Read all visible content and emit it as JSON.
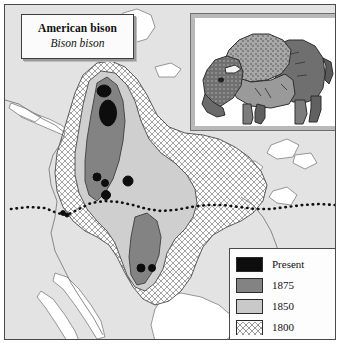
{
  "figure": {
    "title": {
      "common_name": "American bison",
      "scientific_name": "Bison bison"
    },
    "illustration": {
      "subject": "american-bison",
      "description": "Shaded line drawing of an adult American bison in left profile"
    },
    "legend": {
      "items": [
        {
          "label": "Present",
          "pattern": "solid",
          "color": "#0d0d0d"
        },
        {
          "label": "1875",
          "pattern": "solid",
          "color": "#838383"
        },
        {
          "label": "1850",
          "pattern": "solid",
          "color": "#c9c9c9"
        },
        {
          "label": "1800",
          "pattern": "crosshatch",
          "color": "#ffffff"
        }
      ]
    },
    "map": {
      "region": "North America",
      "land_color": "#e3e3e3",
      "water_color": "#ffffff",
      "border_line": "United States - Canada border (dotted)"
    }
  }
}
